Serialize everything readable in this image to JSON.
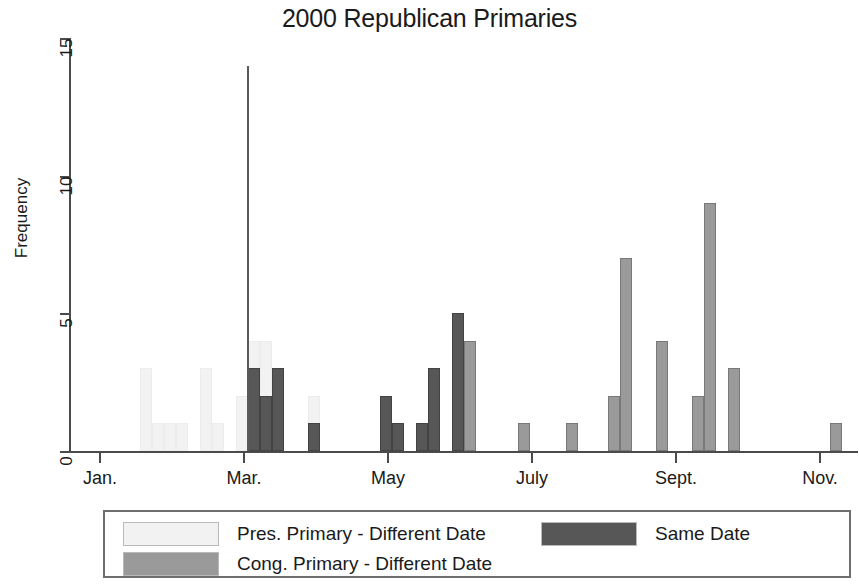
{
  "chart_data": {
    "type": "bar",
    "title": "2000 Republican Primaries",
    "xlabel": "",
    "ylabel": "Frequency",
    "ylim": [
      0,
      15
    ],
    "yticks": [
      0,
      5,
      10,
      15
    ],
    "ytick_labels": [
      "0",
      "5",
      "10",
      "15"
    ],
    "xtick_labels": [
      "Jan.",
      "Mar.",
      "May",
      "July",
      "Sept.",
      "Nov."
    ],
    "xtick_months": [
      1,
      3,
      5,
      7,
      9,
      11
    ],
    "grid": false,
    "legend_position": "below-axes",
    "annotations": [
      {
        "name": "super-tuesday-reference-line",
        "type": "vertical-line",
        "x_month": 3.05,
        "y_top": 14,
        "color": "#5a5a5a"
      }
    ],
    "series": [
      {
        "name": "Pres. Primary - Different Date",
        "key": "pres_diff",
        "color": "#f2f2f2",
        "points": [
          {
            "x_px": 140,
            "value": 3
          },
          {
            "x_px": 152,
            "value": 1
          },
          {
            "x_px": 164,
            "value": 1
          },
          {
            "x_px": 176,
            "value": 1
          },
          {
            "x_px": 200,
            "value": 3
          },
          {
            "x_px": 212,
            "value": 1
          },
          {
            "x_px": 236,
            "value": 2
          },
          {
            "x_px": 248,
            "value": 4
          },
          {
            "x_px": 260,
            "value": 4
          },
          {
            "x_px": 308,
            "value": 2
          }
        ]
      },
      {
        "name": "Cong. Primary - Different Date",
        "key": "cong_diff",
        "color": "#9a9a9a",
        "points": [
          {
            "x_px": 464,
            "value": 4
          },
          {
            "x_px": 518,
            "value": 1
          },
          {
            "x_px": 566,
            "value": 1
          },
          {
            "x_px": 608,
            "value": 2
          },
          {
            "x_px": 620,
            "value": 7
          },
          {
            "x_px": 656,
            "value": 4
          },
          {
            "x_px": 692,
            "value": 2
          },
          {
            "x_px": 704,
            "value": 9
          },
          {
            "x_px": 728,
            "value": 3
          },
          {
            "x_px": 830,
            "value": 1
          }
        ]
      },
      {
        "name": "Same Date",
        "key": "same_date",
        "color": "#575757",
        "points": [
          {
            "x_px": 248,
            "value": 3
          },
          {
            "x_px": 260,
            "value": 2
          },
          {
            "x_px": 272,
            "value": 3
          },
          {
            "x_px": 308,
            "value": 1
          },
          {
            "x_px": 380,
            "value": 2
          },
          {
            "x_px": 392,
            "value": 1
          },
          {
            "x_px": 416,
            "value": 1
          },
          {
            "x_px": 428,
            "value": 3
          },
          {
            "x_px": 452,
            "value": 5
          }
        ]
      }
    ]
  },
  "legend": {
    "items": [
      {
        "label": "Pres. Primary - Different Date",
        "color": "#f2f2f2",
        "row": 0,
        "col": 0
      },
      {
        "label": "Same Date",
        "color": "#575757",
        "row": 0,
        "col": 1
      },
      {
        "label": "Cong. Primary - Different Date",
        "color": "#9a9a9a",
        "row": 1,
        "col": 0
      }
    ]
  },
  "colors": {
    "axis": "#4b4b4b",
    "text": "#1a1a1a",
    "background": "#ffffff",
    "reference_line": "#5a5a5a"
  }
}
